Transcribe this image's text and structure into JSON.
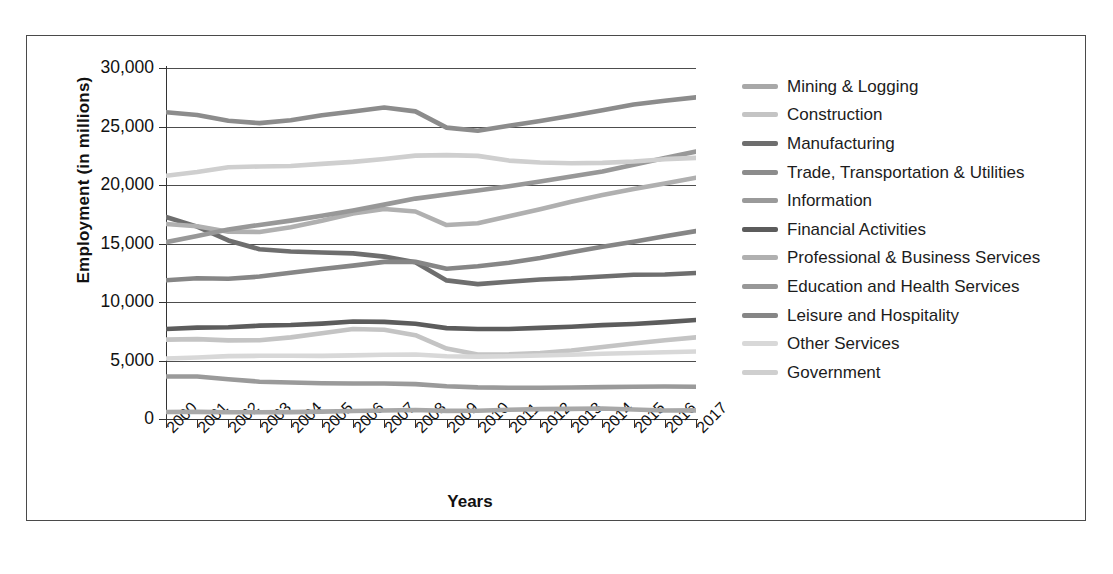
{
  "figure": {
    "ylabel": "Employment (in millions)",
    "xlabel": "Years"
  },
  "axis": {
    "y_ticks": [
      "0",
      "5,000",
      "10,000",
      "15,000",
      "20,000",
      "25,000",
      "30,000"
    ],
    "x_ticks": [
      "2000",
      "2001",
      "2002",
      "2003",
      "2004",
      "2005",
      "2006",
      "2007",
      "2008",
      "2009",
      "2010",
      "2011",
      "2012",
      "2013",
      "2014",
      "2015",
      "2016",
      "2017"
    ]
  },
  "legend": {
    "items": [
      {
        "label": "Mining & Logging",
        "color": "#a8a8a8"
      },
      {
        "label": "Construction",
        "color": "#c4c4c4"
      },
      {
        "label": "Manufacturing",
        "color": "#6e6e6e"
      },
      {
        "label": "Trade, Transportation & Utilities",
        "color": "#8c8c8c"
      },
      {
        "label": "Information",
        "color": "#9a9a9a"
      },
      {
        "label": "Financial Activities",
        "color": "#5c5c5c"
      },
      {
        "label": "Professional & Business Services",
        "color": "#b0b0b0"
      },
      {
        "label": "Education and Health Services",
        "color": "#989898"
      },
      {
        "label": "Leisure and Hospitality",
        "color": "#868686"
      },
      {
        "label": "Other Services",
        "color": "#d8d8d8"
      },
      {
        "label": "Government",
        "color": "#cfcfcf"
      }
    ]
  },
  "chart_data": {
    "type": "line",
    "title": "",
    "xlabel": "Years",
    "ylabel": "Employment (in millions)",
    "ylim": [
      0,
      30000
    ],
    "ytick_step": 5000,
    "grid": true,
    "legend_position": "right",
    "x": [
      2000,
      2001,
      2002,
      2003,
      2004,
      2005,
      2006,
      2007,
      2008,
      2009,
      2010,
      2011,
      2012,
      2013,
      2014,
      2015,
      2016,
      2017
    ],
    "series": [
      {
        "name": "Mining & Logging",
        "color": "#a8a8a8",
        "values": [
          599,
          606,
          583,
          572,
          591,
          628,
          684,
          724,
          767,
          694,
          705,
          788,
          848,
          868,
          898,
          807,
          722,
          739
        ]
      },
      {
        "name": "Construction",
        "color": "#c4c4c4",
        "values": [
          6787,
          6826,
          6716,
          6735,
          6976,
          7336,
          7691,
          7630,
          7162,
          6016,
          5518,
          5533,
          5646,
          5856,
          6149,
          6460,
          6727,
          6974
        ]
      },
      {
        "name": "Manufacturing",
        "color": "#6e6e6e",
        "values": [
          17263,
          16441,
          15259,
          14509,
          14315,
          14226,
          14155,
          13879,
          13406,
          11847,
          11528,
          11726,
          11927,
          12024,
          12185,
          12332,
          12348,
          12478
        ]
      },
      {
        "name": "Trade, Transportation & Utilities",
        "color": "#8c8c8c",
        "values": [
          26225,
          25983,
          25497,
          25287,
          25533,
          25959,
          26276,
          26630,
          26293,
          24906,
          24636,
          25065,
          25477,
          25914,
          26385,
          26883,
          27193,
          27489
        ]
      },
      {
        "name": "Information",
        "color": "#9a9a9a",
        "values": [
          3631,
          3629,
          3395,
          3188,
          3118,
          3061,
          3038,
          3032,
          2984,
          2804,
          2707,
          2674,
          2676,
          2686,
          2727,
          2750,
          2773,
          2751
        ]
      },
      {
        "name": "Financial Activities",
        "color": "#5c5c5c",
        "values": [
          7687,
          7807,
          7847,
          7977,
          8031,
          8153,
          8328,
          8301,
          8145,
          7768,
          7695,
          7697,
          7786,
          7886,
          8022,
          8124,
          8284,
          8459
        ]
      },
      {
        "name": "Professional & Business Services",
        "color": "#b0b0b0",
        "values": [
          16666,
          16476,
          16010,
          15987,
          16394,
          16954,
          17566,
          17942,
          17735,
          16579,
          16728,
          17332,
          17930,
          18563,
          19137,
          19657,
          20127,
          20617
        ]
      },
      {
        "name": "Education and Health Services",
        "color": "#989898",
        "values": [
          15109,
          15645,
          16199,
          16588,
          16953,
          17372,
          17826,
          18322,
          18838,
          19190,
          19528,
          19889,
          20305,
          20734,
          21150,
          21723,
          22316,
          22861
        ]
      },
      {
        "name": "Leisure and Hospitality",
        "color": "#868686",
        "values": [
          11862,
          12036,
          11986,
          12173,
          12493,
          12816,
          13110,
          13427,
          13436,
          12844,
          13049,
          13353,
          13768,
          14254,
          14714,
          15156,
          15620,
          16060
        ]
      },
      {
        "name": "Other Services",
        "color": "#d8d8d8",
        "values": [
          5168,
          5258,
          5372,
          5401,
          5409,
          5395,
          5438,
          5494,
          5515,
          5367,
          5331,
          5360,
          5430,
          5494,
          5573,
          5644,
          5708,
          5767
        ]
      },
      {
        "name": "Government",
        "color": "#cfcfcf",
        "values": [
          20790,
          21118,
          21513,
          21583,
          21621,
          21804,
          21974,
          22218,
          22509,
          22555,
          22490,
          22086,
          21920,
          21864,
          21888,
          22003,
          22208,
          22320
        ]
      }
    ]
  }
}
